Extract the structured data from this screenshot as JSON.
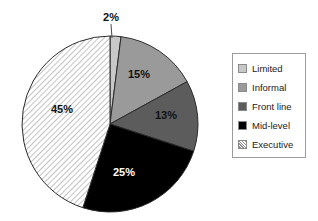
{
  "chart_data": {
    "type": "pie",
    "title": "",
    "labels": [
      "Limited",
      "Informal",
      "Front line",
      "Mid-level",
      "Executive"
    ],
    "values": [
      2,
      15,
      13,
      25,
      45
    ],
    "value_labels": [
      "2%",
      "15%",
      "13%",
      "25%",
      "45%"
    ],
    "colors": [
      "#c8c8c8",
      "#9a9a9a",
      "#5c5c5c",
      "#000000",
      "#ffffff"
    ],
    "fill_styles": [
      "solid",
      "solid",
      "solid",
      "solid",
      "diagonal-hatch"
    ],
    "label_text_colors": [
      "#111111",
      "#111111",
      "#111111",
      "#ffffff",
      "#111111"
    ],
    "start_angle_deg": 0,
    "direction": "clockwise",
    "legend_position": "right",
    "grid": false,
    "xlabel": "",
    "ylabel": ""
  },
  "pie": {
    "center_x": 110,
    "center_y": 124,
    "radius": 88,
    "slices": [
      {
        "key": "limited",
        "label": "Limited",
        "value": 2,
        "value_label": "2%",
        "fill": "#c8c8c8",
        "label_x": 111,
        "label_y": 18,
        "label_fill": "dark",
        "callout": true,
        "callout_x1": 111,
        "callout_y1": 24,
        "callout_x2": 112,
        "callout_y2": 38
      },
      {
        "key": "informal",
        "label": "Informal",
        "value": 15,
        "value_label": "15%",
        "fill": "#9a9a9a",
        "label_x": 139,
        "label_y": 75,
        "label_fill": "dark",
        "callout": false
      },
      {
        "key": "front-line",
        "label": "Front line",
        "value": 13,
        "value_label": "13%",
        "fill": "#5c5c5c",
        "label_x": 166,
        "label_y": 116,
        "label_fill": "dark",
        "callout": false
      },
      {
        "key": "mid-level",
        "label": "Mid-level",
        "value": 25,
        "value_label": "25%",
        "fill": "#000000",
        "label_x": 124,
        "label_y": 173,
        "label_fill": "light",
        "callout": false
      },
      {
        "key": "executive",
        "label": "Executive",
        "value": 45,
        "value_label": "45%",
        "fill": "url(#hatch-pattern)",
        "label_x": 62,
        "label_y": 110,
        "label_fill": "dark",
        "callout": false
      }
    ]
  },
  "legend": {
    "items": [
      {
        "label": "Limited",
        "swatch": "#c8c8c8",
        "style": "solid"
      },
      {
        "label": "Informal",
        "swatch": "#9a9a9a",
        "style": "solid"
      },
      {
        "label": "Front line",
        "swatch": "#5c5c5c",
        "style": "solid"
      },
      {
        "label": "Mid-level",
        "swatch": "#000000",
        "style": "solid"
      },
      {
        "label": "Executive",
        "swatch": "#ffffff",
        "style": "diagonal-hatch"
      }
    ]
  }
}
